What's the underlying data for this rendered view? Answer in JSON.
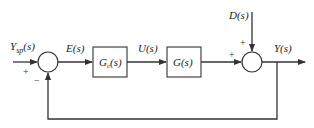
{
  "diagram": {
    "type": "feedback control block diagram",
    "signals": {
      "setpoint": "Y",
      "setpoint_sub": "sp",
      "setpoint_arg": "(s)",
      "error": "E(s)",
      "control": "U(s)",
      "disturbance": "D(s)",
      "output": "Y(s)"
    },
    "blocks": {
      "controller": {
        "name": "G",
        "sub": "c",
        "arg": "(s)"
      },
      "process": {
        "name": "G(s)"
      }
    },
    "summing_junctions": {
      "left": {
        "plus": "+",
        "minus": "−"
      },
      "right": {
        "plus_left": "+",
        "plus_top": "+"
      }
    },
    "colors": {
      "line": "#333333",
      "background": "#ffffff"
    }
  }
}
